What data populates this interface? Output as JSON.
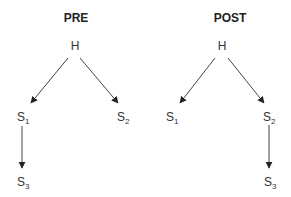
{
  "diagrams": [
    {
      "title": "PRE",
      "nodes": {
        "H": {
          "label": "H"
        },
        "S1": {
          "label": "S",
          "sub": "1"
        },
        "S2": {
          "label": "S",
          "sub": "2"
        },
        "S3": {
          "label": "S",
          "sub": "3"
        }
      },
      "edges": [
        [
          "H",
          "S1"
        ],
        [
          "H",
          "S2"
        ],
        [
          "S1",
          "S3"
        ]
      ]
    },
    {
      "title": "POST",
      "nodes": {
        "H": {
          "label": "H"
        },
        "S1": {
          "label": "S",
          "sub": "1"
        },
        "S2": {
          "label": "S",
          "sub": "2"
        },
        "S3": {
          "label": "S",
          "sub": "3"
        }
      },
      "edges": [
        [
          "H",
          "S1"
        ],
        [
          "H",
          "S2"
        ],
        [
          "S2",
          "S3"
        ]
      ]
    }
  ],
  "colors": {
    "line": "#444444",
    "text": "#333333"
  }
}
